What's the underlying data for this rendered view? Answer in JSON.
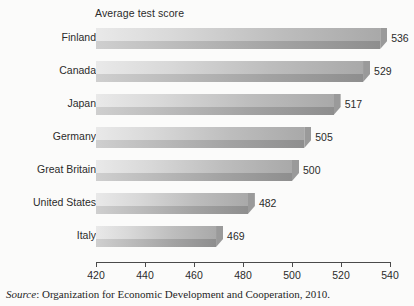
{
  "chart_data": {
    "type": "bar",
    "orientation": "horizontal",
    "title": "Average test score",
    "xlabel": "",
    "ylabel": "",
    "categories": [
      "Finland",
      "Canada",
      "Japan",
      "Germany",
      "Great Britain",
      "United States",
      "Italy"
    ],
    "values": [
      536,
      529,
      517,
      505,
      500,
      482,
      469
    ],
    "data_labels": [
      "536",
      "529",
      "517",
      "505",
      "500",
      "482",
      "469"
    ],
    "xlim": [
      420,
      540
    ],
    "xticks": [
      420,
      440,
      460,
      480,
      500,
      520,
      540
    ],
    "xtick_labels": [
      "420",
      "440",
      "460",
      "480",
      "500",
      "520",
      "540"
    ],
    "grid": false,
    "legend": false,
    "bar_style": "3d-gradient-grey"
  },
  "source": {
    "word": "Source",
    "text": ": Organization for Economic Development and Cooperation, 2010."
  },
  "colors": {
    "background": "#fbfbfa",
    "bar_light": "#e9e9e9",
    "bar_dark": "#8e8e8e",
    "axis": "#4a4a4a",
    "text": "#2b2b2b"
  }
}
